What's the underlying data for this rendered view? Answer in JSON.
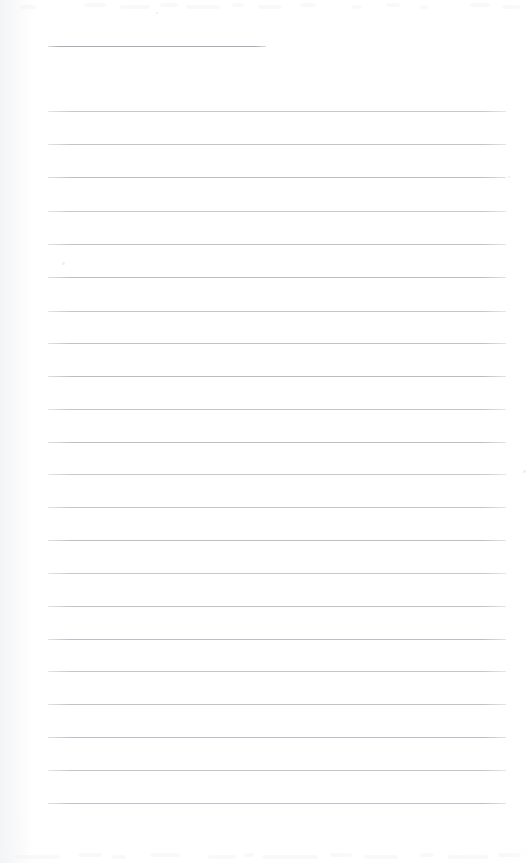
{
  "document": {
    "kind": "scanned-blank-ruled-page",
    "title": "",
    "body_text": "",
    "page_width": 529,
    "page_height": 863,
    "background_color": "#ffffff",
    "rule_color": "#b9bcc4",
    "header_rule_color": "#a9acb4"
  },
  "layout": {
    "content_left": 48,
    "content_right": 506,
    "line_spacing": 32.8
  },
  "header_rule": {
    "label": "",
    "y": 46,
    "x": 48,
    "width": 218
  },
  "rules": [
    {
      "y": 111,
      "x": 48,
      "width": 458
    },
    {
      "y": 144,
      "x": 48,
      "width": 458
    },
    {
      "y": 177,
      "x": 48,
      "width": 458
    },
    {
      "y": 211,
      "x": 48,
      "width": 458
    },
    {
      "y": 244,
      "x": 48,
      "width": 458
    },
    {
      "y": 277,
      "x": 48,
      "width": 458
    },
    {
      "y": 311,
      "x": 48,
      "width": 458
    },
    {
      "y": 343,
      "x": 48,
      "width": 458
    },
    {
      "y": 376,
      "x": 48,
      "width": 458
    },
    {
      "y": 409,
      "x": 48,
      "width": 458
    },
    {
      "y": 442,
      "x": 48,
      "width": 458
    },
    {
      "y": 474,
      "x": 48,
      "width": 458
    },
    {
      "y": 507,
      "x": 48,
      "width": 458
    },
    {
      "y": 540,
      "x": 48,
      "width": 458
    },
    {
      "y": 573,
      "x": 48,
      "width": 458
    },
    {
      "y": 606,
      "x": 48,
      "width": 458
    },
    {
      "y": 639,
      "x": 48,
      "width": 458
    },
    {
      "y": 671,
      "x": 48,
      "width": 458
    },
    {
      "y": 704,
      "x": 48,
      "width": 458
    },
    {
      "y": 737,
      "x": 48,
      "width": 458
    },
    {
      "y": 770,
      "x": 48,
      "width": 458
    },
    {
      "y": 803,
      "x": 48,
      "width": 458
    }
  ],
  "artifacts": {
    "top_ghost_row": {
      "y": 2,
      "height": 12,
      "marks": [
        {
          "x": 20,
          "width": 16
        },
        {
          "x": 84,
          "width": 22
        },
        {
          "x": 120,
          "width": 30
        },
        {
          "x": 160,
          "width": 18
        },
        {
          "x": 186,
          "width": 34
        },
        {
          "x": 232,
          "width": 12
        },
        {
          "x": 258,
          "width": 24
        },
        {
          "x": 300,
          "width": 16
        },
        {
          "x": 352,
          "width": 10
        },
        {
          "x": 386,
          "width": 14
        },
        {
          "x": 420,
          "width": 8
        },
        {
          "x": 470,
          "width": 20
        },
        {
          "x": 502,
          "width": 18
        }
      ]
    },
    "bottom_ghost_row": {
      "y": 852,
      "height": 10,
      "marks": [
        {
          "x": 14,
          "width": 46
        },
        {
          "x": 78,
          "width": 24
        },
        {
          "x": 112,
          "width": 14
        },
        {
          "x": 150,
          "width": 30
        },
        {
          "x": 208,
          "width": 28
        },
        {
          "x": 244,
          "width": 10
        },
        {
          "x": 262,
          "width": 56
        },
        {
          "x": 330,
          "width": 22
        },
        {
          "x": 364,
          "width": 34
        },
        {
          "x": 420,
          "width": 14
        },
        {
          "x": 448,
          "width": 40
        },
        {
          "x": 498,
          "width": 22
        }
      ]
    },
    "specks": [
      {
        "x": 62,
        "y": 262,
        "size": 3
      },
      {
        "x": 156,
        "y": 12,
        "size": 2
      },
      {
        "x": 523,
        "y": 470,
        "size": 3
      },
      {
        "x": 508,
        "y": 176,
        "size": 2
      }
    ]
  }
}
